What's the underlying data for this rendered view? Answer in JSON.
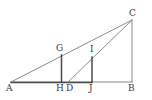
{
  "figure": {
    "type": "geometry-diagram",
    "canvas": {
      "width": 152,
      "height": 100
    },
    "colors": {
      "background": "#ffffff",
      "stroke_light": "#8c8c8c",
      "stroke_dark": "#4a4a4a",
      "label_text": "#3a3a3a"
    },
    "points": [
      {
        "id": "A",
        "label": "A",
        "x": 11,
        "y": 82,
        "label_x": 6,
        "label_y": 84
      },
      {
        "id": "B",
        "label": "B",
        "x": 132,
        "y": 82,
        "label_x": 128,
        "label_y": 84
      },
      {
        "id": "C",
        "label": "C",
        "x": 132,
        "y": 20,
        "label_x": 129,
        "label_y": 9
      },
      {
        "id": "G",
        "label": "G",
        "x": 61,
        "y": 55,
        "label_x": 56,
        "label_y": 44
      },
      {
        "id": "H",
        "label": "H",
        "x": 61,
        "y": 82,
        "label_x": 56,
        "label_y": 84
      },
      {
        "id": "D",
        "label": "D",
        "x": 68,
        "y": 82,
        "label_x": 66,
        "label_y": 84
      },
      {
        "id": "I",
        "label": "I",
        "x": 92,
        "y": 57,
        "label_x": 90,
        "label_y": 45
      },
      {
        "id": "J",
        "label": "J",
        "x": 92,
        "y": 82,
        "label_x": 89,
        "label_y": 84
      }
    ],
    "segments": [
      {
        "id": "AC",
        "from": "A",
        "to": "C",
        "weight": "light"
      },
      {
        "id": "CB",
        "from": "C",
        "to": "B",
        "weight": "light"
      },
      {
        "id": "AB",
        "from": "A",
        "to": "B",
        "weight": "light"
      },
      {
        "id": "AJ",
        "from": "A",
        "to": "J",
        "weight": "dark"
      },
      {
        "id": "DC",
        "from": "D",
        "to": "C",
        "weight": "light"
      },
      {
        "id": "GH",
        "from": "G",
        "to": "H",
        "weight": "dark"
      },
      {
        "id": "IJ",
        "from": "I",
        "to": "J",
        "weight": "dark"
      }
    ]
  }
}
